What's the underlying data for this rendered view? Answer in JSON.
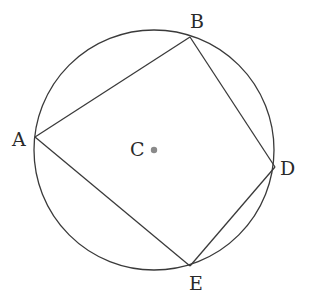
{
  "diagram": {
    "type": "inscribed-quadrilateral",
    "circle": {
      "center": "C",
      "cx": 154,
      "cy": 150,
      "r": 120
    },
    "center_point": {
      "label": "C",
      "x": 154,
      "y": 150,
      "dot_color": "#8a8a8a"
    },
    "vertices": [
      {
        "label": "A",
        "x": 35,
        "y": 137
      },
      {
        "label": "B",
        "x": 190,
        "y": 37
      },
      {
        "label": "D",
        "x": 275,
        "y": 167
      },
      {
        "label": "E",
        "x": 190,
        "y": 266
      }
    ],
    "edges": [
      [
        "A",
        "B"
      ],
      [
        "B",
        "D"
      ],
      [
        "D",
        "E"
      ],
      [
        "E",
        "A"
      ]
    ],
    "labels": {
      "A": "A",
      "B": "B",
      "C": "C",
      "D": "D",
      "E": "E"
    },
    "line_color": "#3a3a3a"
  }
}
